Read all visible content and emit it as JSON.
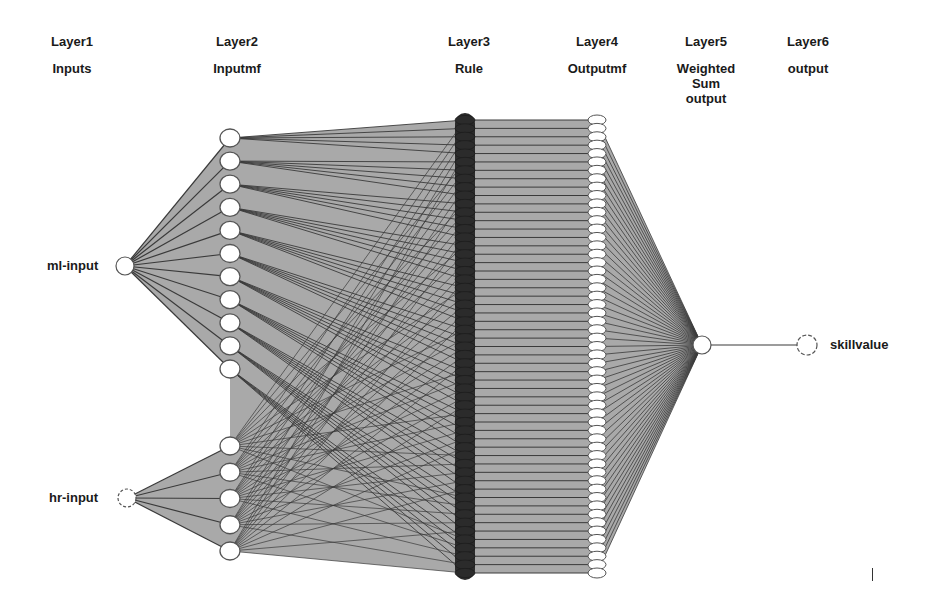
{
  "diagram": {
    "type": "ANFIS network structure",
    "layers": [
      {
        "id": "layer1",
        "title": "Layer1",
        "subtitle": "Inputs",
        "x": 72
      },
      {
        "id": "layer2",
        "title": "Layer2",
        "subtitle": "Inputmf",
        "x": 237
      },
      {
        "id": "layer3",
        "title": "Layer3",
        "subtitle": "Rule",
        "x": 469
      },
      {
        "id": "layer4",
        "title": "Layer4",
        "subtitle": "Outputmf",
        "x": 597
      },
      {
        "id": "layer5",
        "title": "Layer5",
        "subtitle": "Weighted\nSum\noutput",
        "x": 706
      },
      {
        "id": "layer6",
        "title": "Layer6",
        "subtitle": "output",
        "x": 808
      }
    ],
    "inputs": [
      {
        "name": "ml-input",
        "label": "ml-input",
        "mf_count": 11
      },
      {
        "name": "hr-input",
        "label": "hr-input",
        "mf_count": 5
      }
    ],
    "rule_count": 55,
    "output_mf_count": 55,
    "output": {
      "label": "skillvalue"
    },
    "colors": {
      "background": "#ffffff",
      "fill": "#a9a9a9",
      "edge": "#3a3a3a",
      "rule_node": "#2b2b2b",
      "node_fill": "#ffffff",
      "node_stroke": "#555555",
      "text": "#1a1a1a"
    }
  }
}
